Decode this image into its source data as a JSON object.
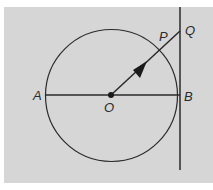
{
  "diagram": {
    "type": "geometry",
    "background_color": "#d6d6d6",
    "stroke_color": "#2a2a2a",
    "circle": {
      "center": "O",
      "cx": 111,
      "cy": 95.5,
      "r": 66
    },
    "points": {
      "A": {
        "label": "A",
        "x": 45,
        "y": 95
      },
      "O": {
        "label": "O",
        "x": 111,
        "y": 95
      },
      "B": {
        "label": "B",
        "x": 179,
        "y": 95
      },
      "P": {
        "label": "P",
        "x": 160,
        "y": 50
      },
      "Q": {
        "label": "Q",
        "x": 180,
        "y": 31
      }
    },
    "segments": [
      {
        "from": "A",
        "to": "B",
        "description": "diameter"
      },
      {
        "from": "O",
        "to": "Q",
        "description": "ray with arrow through P"
      }
    ],
    "tangent_line": {
      "x": 180,
      "y_top": 7,
      "y_bottom": 170,
      "description": "vertical tangent at B"
    }
  }
}
